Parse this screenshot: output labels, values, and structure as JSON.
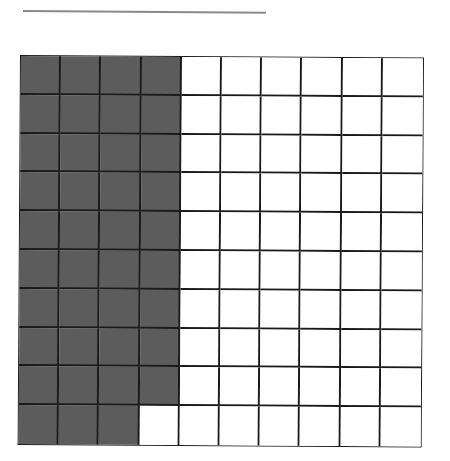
{
  "diagram": {
    "type": "hundred-grid",
    "rows": 10,
    "columns": 10,
    "shaded_count": 39,
    "shading": "columns 1-3 fully shaded, column 4 shaded in rows 1-9",
    "colors": {
      "shaded": "#5c5c5c",
      "unshaded": "#ffffff",
      "lines": "#1a1a1a"
    }
  },
  "answer_line": {
    "text": ""
  }
}
